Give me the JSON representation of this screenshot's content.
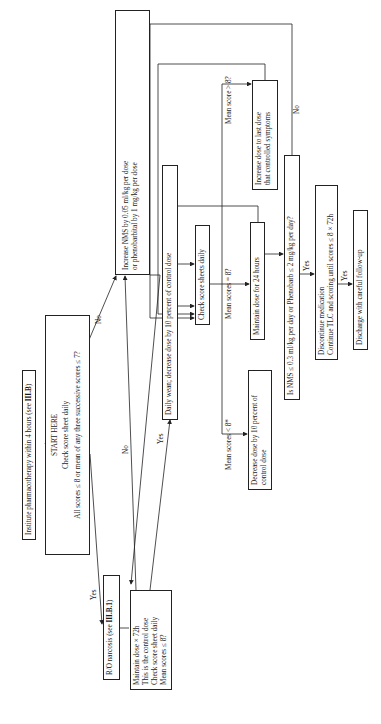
{
  "flowchart": {
    "institute": {
      "text": "Institute pharmacotherapy within 4 hours (see ",
      "ref": "III.B",
      "close": ")"
    },
    "start": {
      "title": "START HERE",
      "line1": "Check score sheet daily",
      "line2": "All scores ≤ 8 or mean of any three successive scores ≤ 7?"
    },
    "ro_narcosis": {
      "text": "R/O narcosis (see ",
      "ref": "III.B.1",
      "close": ")"
    },
    "maintain_72": {
      "line1": "Maintain dose × 72h",
      "line2": "This is the control dose",
      "line3": "Check score sheet daily",
      "line4": "Mean scores ≤ 8?"
    },
    "increase_nms": {
      "line1": "Increase NMS by 0.05 ml/kg per dose",
      "line2": "or phenobarbital by 1 mg/kg per dose"
    },
    "daily_wean": {
      "text": "Daily wean; decrease dose by 10 percent of control dose"
    },
    "check_daily": {
      "text": "Check score sheets daily"
    },
    "mean_lt8": {
      "text": "Mean scores < 8*"
    },
    "mean_eq8": {
      "text": "Mean scores = 8?"
    },
    "mean_gt8": {
      "text": "Mean score > 8?"
    },
    "decrease_dose": {
      "line1": "Decrease dose by 10 percent of",
      "line2": "control dose"
    },
    "maintain_24": {
      "text": "Maintain dose for 24 hours"
    },
    "increase_last": {
      "line1": "Increase dose to last dose",
      "line2": "that controlled symptoms"
    },
    "is_nms": {
      "text": "Is NMS ≤ 0.3 ml/kg per day or Phenobarb ≤ 2 mg/kg per day?"
    },
    "discontinue": {
      "line1": "Discontinue medication",
      "line2": "Continue TLC and scoring until scores ≤ 8 × 72h"
    },
    "discharge": {
      "text": "Discharge with careful follow-up"
    },
    "labels": {
      "yes": "Yes",
      "no": "No"
    }
  }
}
